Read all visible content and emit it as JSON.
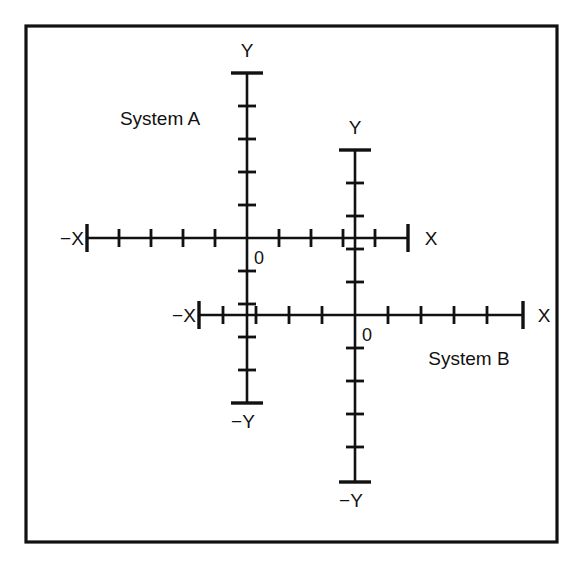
{
  "figure": {
    "background_color": "#ffffff",
    "line_color": "#111111",
    "frame": {
      "x": 26,
      "y": 26,
      "width": 531,
      "height": 516,
      "stroke_width": 3.2
    }
  },
  "chart_data": {
    "type": "scatter",
    "title": "",
    "subtitle": "",
    "xlabel": "",
    "ylabel": "",
    "grid": false,
    "legend": "none",
    "systems": [
      {
        "name": "System A",
        "label_position": {
          "x": 160,
          "y": 125
        },
        "origin": {
          "x": 247,
          "y": 238
        },
        "zero_label": "0",
        "zero_label_position": {
          "x": 254,
          "y": 264
        },
        "axes": {
          "x_positive": {
            "label": "X",
            "label_position": {
              "x": 431,
              "y": 245
            },
            "end": 408,
            "tick_count": 4,
            "tick_spacing": 32,
            "tick_half_length": 9,
            "endcap_half_length": 14
          },
          "x_negative": {
            "label": "−X",
            "label_position": {
              "x": 72,
              "y": 245
            },
            "end": 87,
            "tick_count": 4,
            "tick_spacing": 32,
            "tick_half_length": 9,
            "endcap_half_length": 14
          },
          "y_positive": {
            "label": "Y",
            "label_position": {
              "x": 247,
              "y": 57
            },
            "end": 73,
            "tick_count": 4,
            "tick_spacing": 33,
            "tick_half_length": 9,
            "endcap_half_length": 16
          },
          "y_negative": {
            "label": "−Y",
            "label_position": {
              "x": 243,
              "y": 428
            },
            "end": 403,
            "tick_count": 4,
            "tick_spacing": 33,
            "tick_half_length": 9,
            "endcap_half_length": 16
          }
        }
      },
      {
        "name": "System B",
        "label_position": {
          "x": 469,
          "y": 365
        },
        "origin": {
          "x": 355,
          "y": 315
        },
        "zero_label": "0",
        "zero_label_position": {
          "x": 362,
          "y": 341
        },
        "axes": {
          "x_positive": {
            "label": "X",
            "label_position": {
              "x": 544,
              "y": 322
            },
            "end": 523,
            "tick_count": 4,
            "tick_spacing": 33,
            "tick_half_length": 9,
            "endcap_half_length": 14
          },
          "x_negative": {
            "label": "−X",
            "label_position": {
              "x": 184,
              "y": 322
            },
            "end": 199,
            "tick_count": 4,
            "tick_spacing": 33,
            "tick_half_length": 9,
            "endcap_half_length": 14
          },
          "y_positive": {
            "label": "Y",
            "label_position": {
              "x": 355,
              "y": 134
            },
            "end": 150,
            "tick_count": 4,
            "tick_spacing": 33,
            "tick_half_length": 9,
            "endcap_half_length": 16
          },
          "y_negative": {
            "label": "−Y",
            "label_position": {
              "x": 351,
              "y": 507
            },
            "end": 482,
            "tick_count": 4,
            "tick_spacing": 33,
            "tick_half_length": 9,
            "endcap_half_length": 16
          }
        }
      }
    ]
  }
}
